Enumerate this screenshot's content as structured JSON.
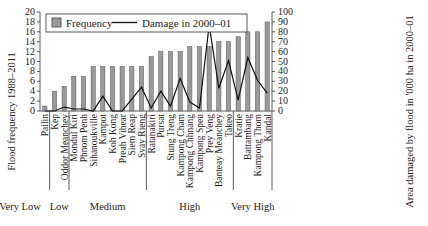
{
  "chart_data": {
    "type": "bar",
    "title": "",
    "xlabel": "",
    "ylabel": "Flood frequency 1988–2011",
    "y2label": "Area damaged by flood in '000 ha in 2000–01",
    "ylim": [
      0,
      20
    ],
    "y2lim": [
      0,
      100
    ],
    "yticks": [
      0,
      2,
      4,
      6,
      8,
      10,
      12,
      14,
      16,
      18,
      20
    ],
    "y2ticks": [
      0,
      10,
      20,
      30,
      40,
      50,
      60,
      70,
      80,
      90,
      100
    ],
    "grid": false,
    "legend_position": "top-left",
    "categories": [
      "Pailin",
      "Kep",
      "Oddor Meanchey",
      "Mondul Kiri",
      "Phnom Penh",
      "Sihanoukville",
      "Kampot",
      "Koh Kong",
      "Preah Vihear",
      "Siem Reap",
      "Svay Rieng",
      "Ratanakiri",
      "Pursat",
      "Stung Treng",
      "Kampong Cham",
      "Kampong Chhnang",
      "Kampong Speu",
      "Prey Veng",
      "Banteay Meanchey",
      "Takeo",
      "Kratie",
      "Battambang",
      "Kampong Thom",
      "Kandal"
    ],
    "series": [
      {
        "name": "Frequency",
        "type": "bar",
        "axis": "left",
        "color": "#9a9a9a",
        "values": [
          1,
          4,
          5,
          7,
          7,
          9,
          9,
          9,
          9,
          9,
          9,
          11,
          12,
          12,
          12,
          13,
          13,
          13,
          14,
          14,
          15,
          16,
          16,
          18
        ]
      },
      {
        "name": "Damage in 2000–01",
        "type": "line",
        "axis": "right",
        "color": "#111111",
        "values": [
          0,
          0,
          4,
          2,
          2,
          0,
          15,
          0,
          0,
          12,
          24,
          3,
          20,
          5,
          33,
          9,
          3,
          87,
          23,
          51,
          11,
          54,
          31,
          18
        ]
      }
    ],
    "groups": [
      {
        "label": "Very Low",
        "start": 0,
        "end": 0
      },
      {
        "label": "Low",
        "start": 1,
        "end": 2
      },
      {
        "label": "Medium",
        "start": 3,
        "end": 10
      },
      {
        "label": "High",
        "start": 11,
        "end": 19
      },
      {
        "label": "Very High",
        "start": 20,
        "end": 23
      }
    ]
  },
  "legend": {
    "frequency_label": "Frequency",
    "damage_label": "Damage in 2000–01"
  }
}
